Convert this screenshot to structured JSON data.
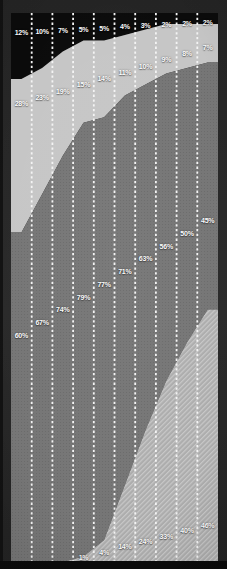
{
  "chart_data": {
    "type": "area",
    "stacked": true,
    "units": "percent",
    "title": "",
    "xlabel": "",
    "ylabel": "",
    "ylim": [
      0,
      100
    ],
    "columns": 10,
    "grid": false,
    "legend": "none",
    "column_separator": {
      "style": "dotted",
      "color": "#f4f4f4"
    },
    "background_color": "#262626",
    "border_bottom_color": "#0b0b0b",
    "series": [
      {
        "name": "top-black-band",
        "key": "black",
        "color": "#0b0b0b",
        "texture": {
          "type": "none"
        },
        "values": [
          12,
          10,
          7,
          5,
          5,
          4,
          3,
          2,
          2,
          2
        ],
        "labels": [
          "12%",
          "10%",
          "7%",
          "5%",
          "5%",
          "4%",
          "3%",
          "2%",
          "2%",
          "2%"
        ]
      },
      {
        "name": "upper-light-gray-band",
        "key": "lightgray",
        "color": "#c6c6c6",
        "texture": {
          "type": "none"
        },
        "values": [
          28,
          23,
          19,
          15,
          14,
          11,
          10,
          9,
          8,
          7
        ],
        "labels": [
          "28%",
          "23%",
          "19%",
          "15%",
          "14%",
          "11%",
          "10%",
          "9%",
          "8%",
          "7%"
        ]
      },
      {
        "name": "middle-dark-gray-band",
        "key": "darkgray",
        "color": "#757575",
        "texture": {
          "type": "dots",
          "base": "#767676",
          "dot": "#6b6b6b"
        },
        "values": [
          60,
          67,
          74,
          79,
          77,
          71,
          63,
          56,
          50,
          45
        ],
        "labels": [
          "60%",
          "67%",
          "74%",
          "79%",
          "77%",
          "71%",
          "63%",
          "56%",
          "50%",
          "45%"
        ]
      },
      {
        "name": "bottom-hatched-band",
        "key": "hatch",
        "color": "#b1b1b1",
        "texture": {
          "type": "hatch",
          "base": "#adadad",
          "line": "#c8c8c8"
        },
        "values": [
          0,
          0,
          0,
          1,
          4,
          14,
          24,
          33,
          40,
          46
        ],
        "labels": [
          "",
          "",
          "",
          "1%",
          "4%",
          "14%",
          "24%",
          "33%",
          "40%",
          "46%"
        ]
      }
    ]
  }
}
